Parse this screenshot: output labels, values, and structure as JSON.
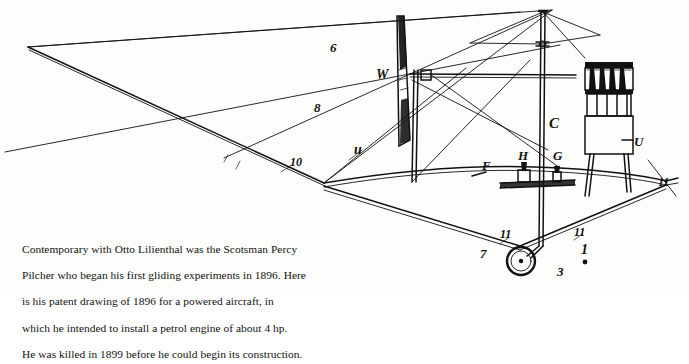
{
  "document": {
    "type": "book-page-figure",
    "background_color": "#fdfdfb",
    "ink_color": "#111111"
  },
  "figure": {
    "name": "percy-pilcher-1896-patent-drawing",
    "labels": [
      {
        "id": "label-6",
        "text": "6",
        "x": 330,
        "y": 52
      },
      {
        "id": "label-8",
        "text": "8",
        "x": 314,
        "y": 112
      },
      {
        "id": "label-10",
        "text": "10",
        "x": 290,
        "y": 166
      },
      {
        "id": "label-u-left",
        "text": "u",
        "x": 360,
        "y": 152
      },
      {
        "id": "label-w",
        "text": "W",
        "x": 386,
        "y": 74
      },
      {
        "id": "label-f",
        "text": "F",
        "x": 482,
        "y": 168
      },
      {
        "id": "label-h",
        "text": "H",
        "x": 521,
        "y": 156
      },
      {
        "id": "label-g",
        "text": "G",
        "x": 556,
        "y": 156
      },
      {
        "id": "label-c",
        "text": "C",
        "x": 551,
        "y": 122
      },
      {
        "id": "label-u-right",
        "text": "U",
        "x": 634,
        "y": 142
      },
      {
        "id": "label-11-right",
        "text": "11",
        "x": 662,
        "y": 180
      },
      {
        "id": "label-11-left-low",
        "text": "11",
        "x": 504,
        "y": 235
      },
      {
        "id": "label-7",
        "text": "7",
        "x": 484,
        "y": 253
      },
      {
        "id": "label-11-right-low",
        "text": "11",
        "x": 578,
        "y": 234
      },
      {
        "id": "label-1",
        "text": "1",
        "x": 585,
        "y": 254
      },
      {
        "id": "label-3",
        "text": "3",
        "x": 561,
        "y": 272
      }
    ],
    "parts": {
      "mast": "vertical-mast",
      "engine": "petrol-engine-cylinders",
      "wheel": "landing-wheel",
      "wing_spars": "wing-spar-frame",
      "rudder": "vertical-surface-W"
    }
  },
  "caption": {
    "lines": [
      "Contemporary with Otto Lilienthal was the Scotsman Percy",
      "Pilcher who began his first gliding experiments in 1896. Here",
      "is his patent drawing of 1896 for a powered aircraft, in",
      "which he intended to install a petrol engine of about 4 hp.",
      "He was killed in 1899 before he could begin its construction."
    ],
    "full_text": "Contemporary with Otto Lilienthal was the Scotsman Percy Pilcher who began his first gliding experiments in 1896. Here is his patent drawing of 1896 for a powered aircraft, in which he intended to install a petrol engine of about 4 hp. He was killed in 1899 before he could begin its construction."
  }
}
